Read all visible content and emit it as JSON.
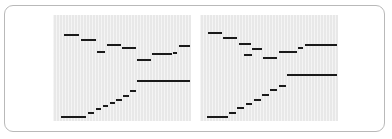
{
  "figure": {
    "title": "",
    "frame_border_color": "#b9b9b9",
    "background_color": "#ffffff",
    "panel_background_color": "#e8e8e8",
    "series_color": "#1a1a1a"
  },
  "panels": [
    {
      "name": "left-panel",
      "label": "",
      "x": 52,
      "y": 14,
      "width": 138,
      "height": 106
    },
    {
      "name": "right-panel",
      "label": "",
      "x": 199,
      "y": 14,
      "width": 138,
      "height": 106
    }
  ],
  "chart_data": [
    {
      "type": "line",
      "name": "left-panel",
      "title": "",
      "subtitle": "",
      "xlabel": "",
      "ylabel": "",
      "xlim": [
        0,
        100
      ],
      "ylim": [
        0,
        100
      ],
      "grid": false,
      "legend": null,
      "series": [
        {
          "name": "upper-step-series",
          "style": "piecewise-constant",
          "segments": [
            {
              "x0": 8,
              "x1": 19,
              "y": 81
            },
            {
              "x0": 20,
              "x1": 31,
              "y": 76
            },
            {
              "x0": 32,
              "x1": 38,
              "y": 65
            },
            {
              "x0": 39,
              "x1": 49,
              "y": 72
            },
            {
              "x0": 50,
              "x1": 60,
              "y": 69
            },
            {
              "x0": 61,
              "x1": 71,
              "y": 58
            },
            {
              "x0": 72,
              "x1": 86,
              "y": 63
            },
            {
              "x0": 87,
              "x1": 90,
              "y": 64
            },
            {
              "x0": 91,
              "x1": 99,
              "y": 71
            }
          ]
        },
        {
          "name": "lower-step-series",
          "style": "piecewise-constant-staircase",
          "segments": [
            {
              "x0": 6,
              "x1": 24,
              "y": 4
            },
            {
              "x0": 25,
              "x1": 30,
              "y": 8
            },
            {
              "x0": 31,
              "x1": 35,
              "y": 11
            },
            {
              "x0": 36,
              "x1": 40,
              "y": 14
            },
            {
              "x0": 41,
              "x1": 45,
              "y": 17
            },
            {
              "x0": 46,
              "x1": 50,
              "y": 20
            },
            {
              "x0": 51,
              "x1": 55,
              "y": 24
            },
            {
              "x0": 56,
              "x1": 60,
              "y": 28
            },
            {
              "x0": 61,
              "x1": 99,
              "y": 38
            }
          ]
        }
      ]
    },
    {
      "type": "line",
      "name": "right-panel",
      "title": "",
      "subtitle": "",
      "xlabel": "",
      "ylabel": "",
      "xlim": [
        0,
        100
      ],
      "ylim": [
        0,
        100
      ],
      "grid": false,
      "legend": null,
      "series": [
        {
          "name": "upper-step-series",
          "style": "piecewise-constant",
          "segments": [
            {
              "x0": 6,
              "x1": 16,
              "y": 83
            },
            {
              "x0": 17,
              "x1": 27,
              "y": 78
            },
            {
              "x0": 28,
              "x1": 37,
              "y": 73
            },
            {
              "x0": 38,
              "x1": 45,
              "y": 68
            },
            {
              "x0": 32,
              "x1": 38,
              "y": 62
            },
            {
              "x0": 46,
              "x1": 56,
              "y": 59
            },
            {
              "x0": 57,
              "x1": 70,
              "y": 65
            },
            {
              "x0": 71,
              "x1": 75,
              "y": 69
            },
            {
              "x0": 76,
              "x1": 99,
              "y": 72
            }
          ]
        },
        {
          "name": "lower-step-series",
          "style": "piecewise-constant-staircase",
          "segments": [
            {
              "x0": 5,
              "x1": 20,
              "y": 4
            },
            {
              "x0": 21,
              "x1": 26,
              "y": 8
            },
            {
              "x0": 27,
              "x1": 32,
              "y": 12
            },
            {
              "x0": 33,
              "x1": 38,
              "y": 16
            },
            {
              "x0": 39,
              "x1": 44,
              "y": 20
            },
            {
              "x0": 45,
              "x1": 50,
              "y": 25
            },
            {
              "x0": 51,
              "x1": 56,
              "y": 29
            },
            {
              "x0": 57,
              "x1": 62,
              "y": 33
            },
            {
              "x0": 63,
              "x1": 99,
              "y": 43
            }
          ]
        }
      ]
    }
  ]
}
